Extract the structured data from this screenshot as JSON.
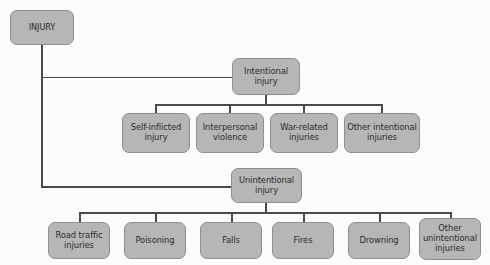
{
  "diagram": {
    "type": "hierarchy-tree",
    "colors": {
      "node_fill": "#b6b6b6",
      "node_border": "#8f8f8f",
      "connector": "#4a4a4a",
      "text": "#2b2b2b",
      "background": "#fcfcfc"
    },
    "root": {
      "id": "injury",
      "label": "INJURY"
    },
    "branches": [
      {
        "id": "intentional-injury",
        "label_line1": "Intentional",
        "label_line2": "injury",
        "children": [
          {
            "id": "self-inflicted-injury",
            "label_line1": "Self-inflicted",
            "label_line2": "injury",
            "label_line3": ""
          },
          {
            "id": "interpersonal-violence",
            "label_line1": "Interpersonal",
            "label_line2": "violence",
            "label_line3": ""
          },
          {
            "id": "war-related-injuries",
            "label_line1": "War-related",
            "label_line2": "injuries",
            "label_line3": ""
          },
          {
            "id": "other-intentional-injuries",
            "label_line1": "Other intentional",
            "label_line2": "injuries",
            "label_line3": ""
          }
        ]
      },
      {
        "id": "unintentional-injury",
        "label_line1": "Unintentional",
        "label_line2": "injury",
        "children": [
          {
            "id": "road-traffic-injuries",
            "label_line1": "Road traffic",
            "label_line2": "injuries",
            "label_line3": ""
          },
          {
            "id": "poisoning",
            "label_line1": "Poisoning",
            "label_line2": "",
            "label_line3": ""
          },
          {
            "id": "falls",
            "label_line1": "Falls",
            "label_line2": "",
            "label_line3": ""
          },
          {
            "id": "fires",
            "label_line1": "Fires",
            "label_line2": "",
            "label_line3": ""
          },
          {
            "id": "drowning",
            "label_line1": "Drowning",
            "label_line2": "",
            "label_line3": ""
          },
          {
            "id": "other-unintentional-injuries",
            "label_line1": "Other",
            "label_line2": "unintentional",
            "label_line3": "injuries"
          }
        ]
      }
    ]
  }
}
